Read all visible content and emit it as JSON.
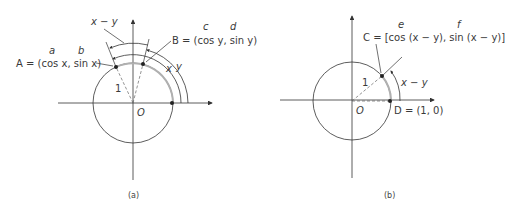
{
  "figure_a": {
    "caption": "(a)",
    "origin_label": "O",
    "radius_label": "1",
    "point_A": {
      "name": "A",
      "label": "A = (cos x, sin x)",
      "coord_tags": [
        "a",
        "b"
      ]
    },
    "point_B": {
      "name": "B",
      "label": "B = (cos y, sin y)",
      "coord_tags": [
        "c",
        "d"
      ]
    },
    "arc_labels": {
      "diff": "x − y",
      "x": "x",
      "y": "y"
    }
  },
  "figure_b": {
    "caption": "(b)",
    "origin_label": "O",
    "radius_label": "1",
    "point_C": {
      "name": "C",
      "label": "C = [cos (x − y), sin (x − y)]",
      "coord_tags": [
        "e",
        "f"
      ]
    },
    "point_D": {
      "name": "D",
      "label": "D = (1, 0)"
    },
    "arc_label": "x − y"
  },
  "colors": {
    "line": "#333333",
    "gray_arc": "#b0b0b0",
    "text": "#3a3a3a"
  }
}
